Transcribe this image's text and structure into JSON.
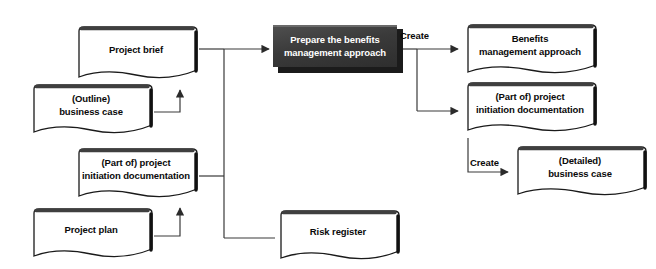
{
  "diagram": {
    "background_color": "#ffffff",
    "line_color": "#3a3a3a",
    "process_fill_color": "#3d3d3d",
    "process_text_color": "#ffffff",
    "document_fill_color": "#ffffff",
    "document_border_color": "#1a1a1a",
    "nodes": [
      {
        "id": "project-brief",
        "type": "document",
        "label": "Project brief",
        "x": 73,
        "y": 26,
        "w": 126,
        "h": 60
      },
      {
        "id": "outline-business-case",
        "type": "document",
        "label": "(Outline)\nbusiness case",
        "x": 28,
        "y": 84,
        "w": 126,
        "h": 56
      },
      {
        "id": "part-of-pid-input",
        "type": "document",
        "label": "(Part of) project\ninitiation documentation",
        "x": 73,
        "y": 148,
        "w": 126,
        "h": 56
      },
      {
        "id": "project-plan",
        "type": "document",
        "label": "Project plan",
        "x": 28,
        "y": 208,
        "w": 126,
        "h": 56
      },
      {
        "id": "risk-register",
        "type": "document",
        "label": "Risk register",
        "x": 275,
        "y": 210,
        "w": 126,
        "h": 56
      },
      {
        "id": "prepare-benefits-management-approach",
        "type": "process",
        "label": "Prepare the benefits\nmanagement approach",
        "x": 273,
        "y": 25,
        "w": 130,
        "h": 48
      },
      {
        "id": "benefits-management-approach",
        "type": "document",
        "label": "Benefits\nmanagement approach",
        "x": 462,
        "y": 24,
        "w": 136,
        "h": 56
      },
      {
        "id": "part-of-pid-output",
        "type": "document",
        "label": "(Part of) project\ninitiation documentation",
        "x": 462,
        "y": 82,
        "w": 136,
        "h": 56
      },
      {
        "id": "detailed-business-case",
        "type": "document",
        "label": "(Detailed)\nbusiness case",
        "x": 512,
        "y": 146,
        "w": 136,
        "h": 56
      }
    ],
    "edge_labels": [
      {
        "id": "create-benefits",
        "text": "Create",
        "x": 400,
        "y": 30
      },
      {
        "id": "create-business-case",
        "text": "Create",
        "x": 470,
        "y": 157
      }
    ]
  }
}
